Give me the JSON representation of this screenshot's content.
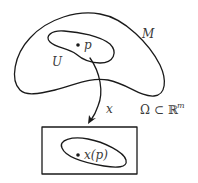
{
  "diagram": {
    "manifold": {
      "label": "M"
    },
    "open_set": {
      "label": "U"
    },
    "point": {
      "label": "p"
    },
    "chart_map": {
      "label": "x"
    },
    "codomain": {
      "omega": "Ω",
      "subset": "⊂",
      "space": "ℝ",
      "exponent": "m"
    },
    "image": {
      "label": "x(p)"
    },
    "colors": {
      "stroke": "#1a1a1a",
      "text": "#3a3a3a",
      "background": "#ffffff"
    }
  }
}
